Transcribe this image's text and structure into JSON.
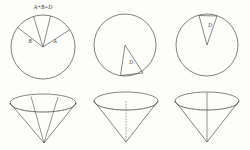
{
  "figure": {
    "title_equation": "A+B=D",
    "background_color": "#fdfdfb",
    "stroke_color": "#4a4a4a",
    "panels": [
      {
        "id": "panel-1",
        "circle_label_left": "B",
        "circle_label_right": "A",
        "sector_count": 2,
        "cone_internal_lines": 2,
        "cone_axis_style": "none"
      },
      {
        "id": "panel-2",
        "circle_label": "D",
        "sector_count": 1,
        "sector_direction": "down",
        "cone_internal_lines": 0,
        "cone_axis_style": "dashed"
      },
      {
        "id": "panel-3",
        "circle_label": "D",
        "sector_count": 1,
        "sector_direction": "up",
        "cone_internal_lines": 0,
        "cone_axis_style": "solid"
      }
    ],
    "labels": {
      "equation": "A+B=D",
      "p1_left": "B",
      "p1_right": "A",
      "p2_wedge": "D",
      "p3_wedge": "D"
    }
  }
}
